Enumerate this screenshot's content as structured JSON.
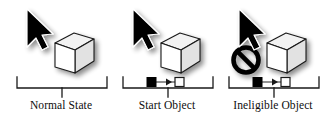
{
  "figure": {
    "background_color": "#ffffff",
    "panel_count": 3
  },
  "colors": {
    "ink": "#111111",
    "cursor_fill": "#000000",
    "cursor_outline": "#ffffff",
    "box_front": "#ffffff",
    "box_top": "#f2f2f2",
    "box_side": "#e2e2e2",
    "box_outline": "#1a1a1a",
    "shadow": "#b4b4b4",
    "bracket": "#1a1a1a",
    "connector_start_fill": "#000000",
    "connector_end_fill": "#ffffff",
    "prohibition": "#000000",
    "caption_color": "#0d0d0d"
  },
  "panels": [
    {
      "id": "normal-state",
      "caption": "Normal State",
      "has_cursor": true,
      "has_box": true,
      "has_connector": false,
      "has_prohibition": false
    },
    {
      "id": "start-object",
      "caption": "Start Object",
      "has_cursor": true,
      "has_box": true,
      "has_connector": true,
      "has_prohibition": false
    },
    {
      "id": "ineligible-object",
      "caption": "Ineligible Object",
      "has_cursor": true,
      "has_box": true,
      "has_connector": true,
      "has_prohibition": true
    }
  ],
  "icons": {
    "cursor": "mouse-pointer-arrow",
    "box": "3d-cube-object",
    "connector": "connector-link-arrow",
    "prohibition": "no-entry-prohibition-sign",
    "bracket": "measure-bracket"
  }
}
